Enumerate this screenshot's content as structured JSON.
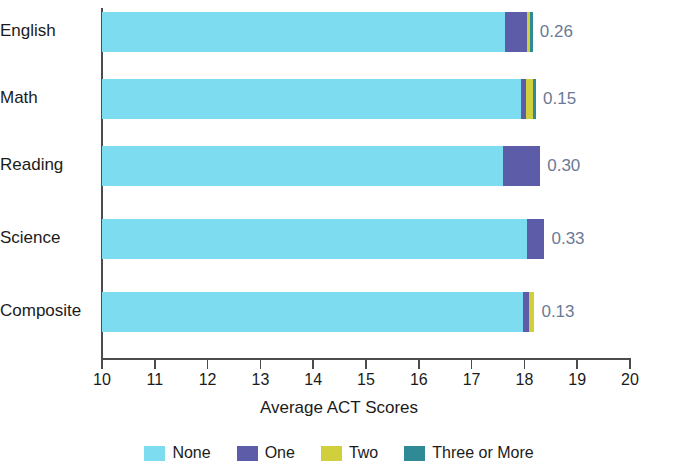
{
  "chart_data": {
    "type": "bar",
    "orientation": "horizontal",
    "stacked": true,
    "title": "",
    "xlabel": "Average ACT Scores",
    "ylabel": "",
    "xlim": [
      10,
      20
    ],
    "xticks": [
      10,
      11,
      12,
      13,
      14,
      15,
      16,
      17,
      18,
      19,
      20
    ],
    "xtick_labels": [
      "10",
      "11",
      "12",
      "13",
      "14",
      "15",
      "16",
      "17",
      "18",
      "19",
      "20"
    ],
    "grid": false,
    "legend_position": "bottom",
    "categories": [
      "English",
      "Math",
      "Reading",
      "Science",
      "Composite"
    ],
    "series": [
      {
        "name": "None",
        "color": "#7edcf0",
        "values": [
          17.63,
          17.94,
          17.6,
          18.05,
          17.97
        ]
      },
      {
        "name": "One",
        "color": "#5c5ca8",
        "values": [
          18.04,
          18.04,
          18.3,
          18.38,
          18.08
        ]
      },
      {
        "name": "Two",
        "color": "#d2cf3d",
        "values": [
          18.1,
          18.16,
          18.3,
          18.38,
          18.19
        ]
      },
      {
        "name": "Three or More",
        "color": "#2e8a94",
        "values": [
          18.16,
          18.22,
          18.3,
          18.38,
          18.19
        ]
      }
    ],
    "value_labels": [
      "0.26",
      "0.15",
      "0.30",
      "0.33",
      "0.13"
    ],
    "value_label_color": "#6a7a96",
    "axis_color": "#4c4c4c",
    "background": "#ffffff"
  },
  "legend": {
    "items": [
      {
        "label": "None",
        "color": "#7edcf0"
      },
      {
        "label": "One",
        "color": "#5c5ca8"
      },
      {
        "label": "Two",
        "color": "#d2cf3d"
      },
      {
        "label": "Three or More",
        "color": "#2e8a94"
      }
    ]
  }
}
